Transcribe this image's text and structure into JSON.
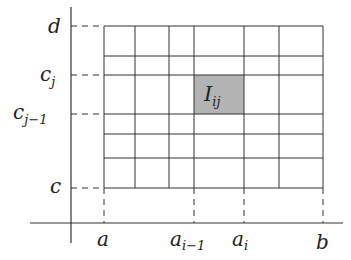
{
  "diagram": {
    "x_labels": {
      "a": "a",
      "a_i_minus_1_base": "a",
      "a_i_minus_1_sub": "i−1",
      "a_i_base": "a",
      "a_i_sub": "i",
      "b": "b"
    },
    "y_labels": {
      "d": "d",
      "c_j_base": "c",
      "c_j_sub": "j",
      "c_j_minus_1_base": "c",
      "c_j_minus_1_sub": "j−1",
      "c": "c"
    },
    "cell_label": {
      "base": "I",
      "sub": "ij"
    },
    "grid": {
      "vertical_x": [
        104,
        135,
        169,
        194,
        244,
        279,
        323
      ],
      "horizontal_y": [
        26,
        56,
        75,
        114,
        134,
        158,
        188
      ]
    },
    "highlight_cell": {
      "x0": 194,
      "x1": 244,
      "y0": 75,
      "y1": 114
    },
    "colors": {
      "grid_line": "#333333",
      "axis_line": "#333333",
      "highlight_fill": "#b3b3b3",
      "dash_line": "#333333",
      "background": "#ffffff"
    }
  }
}
